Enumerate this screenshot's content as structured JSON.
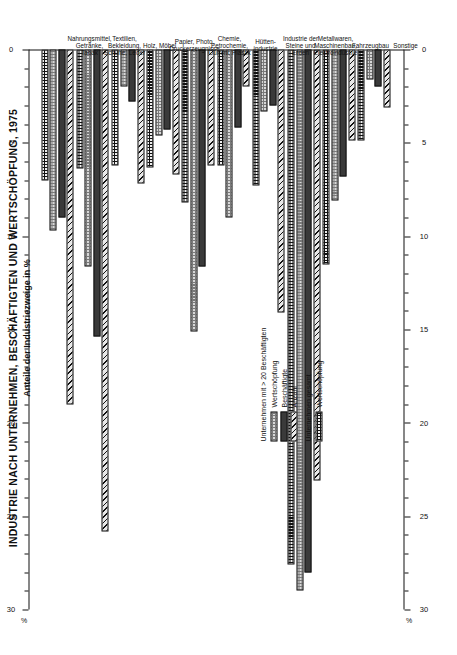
{
  "title": {
    "line1": "INDUSTRIE NACH UNTERNEHMEN, BESCHÄFTIGTEN UND WERTSCHÖPFUNG, 1975",
    "line2": "Anteile der Industriezweige in %"
  },
  "axis": {
    "unit_label": "%",
    "ticks": [
      30,
      25,
      20,
      15,
      10,
      5,
      0
    ]
  },
  "legend": {
    "group1_header": "Unternehmen mit > 20 Beschäftigten",
    "group1_items": [
      {
        "label": "Wertschöpfung",
        "key": "wert20"
      },
      {
        "label": "Beschäftigte",
        "key": "besch"
      },
      {
        "label": "Anzahl",
        "key": "anzahl"
      }
    ],
    "group2_header": "Unternehmen gesamt",
    "group2_items": [
      {
        "label": "Wertschöpfung",
        "key": "wertges"
      }
    ]
  },
  "chart_data": {
    "type": "bar",
    "orientation": "horizontal",
    "title": "INDUSTRIE NACH UNTERNEHMEN, BESCHÄFTIGTEN UND WERTSCHÖPFUNG, 1975",
    "subtitle": "Anteile der Industriezweige in %",
    "xlabel": "%",
    "ylabel": "",
    "xlim": [
      0,
      30
    ],
    "grid": false,
    "legend_position": "center",
    "categories": [
      "Nahrungsmittel,\nGetränke,\nTabak",
      "Textilien,\nBekleidung,\nSchuhe, Leder",
      "Holz, Möbel",
      "Papier, Photo,\nDruckerzeugnisse",
      "Chemie,\nPetrochemie,\nGummi, Plastik",
      "Hütten-\nindustrie",
      "Industrie der\nSteine und\nErden",
      "Metallwaren,\nMaschinenbau,\nElektroindustrie",
      "Fahrzeugbau",
      "Sonstige"
    ],
    "series": [
      {
        "name": "Wertschöpfung (Unternehmen gesamt)",
        "key": "wertges",
        "values": [
          7.0,
          6.4,
          6.2,
          6.3,
          8.2,
          6.2,
          7.3,
          27.6,
          11.5,
          4.9
        ]
      },
      {
        "name": "Wertschöpfung (Unternehmen mit > 20 Beschäftigten)",
        "key": "wert20",
        "values": [
          9.7,
          11.6,
          2.0,
          4.6,
          15.1,
          9.0,
          3.3,
          29.0,
          8.1,
          1.6
        ]
      },
      {
        "name": "Beschäftigte",
        "key": "besch",
        "values": [
          9.0,
          15.4,
          2.8,
          4.3,
          11.6,
          4.2,
          3.0,
          28.0,
          6.8,
          2.0
        ]
      },
      {
        "name": "Anzahl",
        "key": "anzahl",
        "values": [
          19.0,
          25.8,
          7.2,
          6.7,
          6.2,
          2.0,
          14.1,
          23.1,
          4.9,
          3.1
        ]
      }
    ]
  }
}
